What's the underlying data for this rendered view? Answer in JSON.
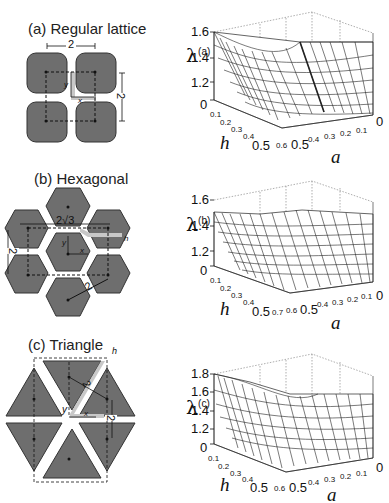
{
  "figure": {
    "panels": [
      {
        "id": "a",
        "title": "(a) Regular lattice",
        "annotations": {
          "width_label": "2",
          "height_label": "2",
          "x_label": "x",
          "y_label": "y"
        },
        "plot": {
          "ylabel": "λ",
          "ylabel_sup": "(a)",
          "z_ticks": [
            "1.6",
            "1.4",
            "1.2",
            "0"
          ],
          "h_ticks_small": [
            "0.1",
            "0.2",
            "0.3",
            "0.4"
          ],
          "h_tick_large": "0.5",
          "a_ticks_small": [
            "0.6",
            "0.4",
            "0.3",
            "0.2",
            "0.1"
          ],
          "a_tick_large_mid": "0.5",
          "a_tick_zero": "0",
          "h_label": "h",
          "a_label": "a"
        }
      },
      {
        "id": "b",
        "title": "(b) Hexagonal",
        "annotations": {
          "width_label": "2√3",
          "height_label": "2",
          "diag_label": "2",
          "h_label": "h",
          "x_label": "x",
          "y_label": "y"
        },
        "plot": {
          "ylabel": "λ",
          "ylabel_sup": "(b)",
          "z_ticks": [
            "1.6",
            "1.4",
            "1.2",
            "0"
          ],
          "h_ticks_small": [
            "0.1",
            "0.2",
            "0.3",
            "0.4"
          ],
          "h_tick_large": "0.5",
          "a_ticks_small": [
            "0.7",
            "0.6",
            "0.4",
            "0.3",
            "0.2",
            "0.1"
          ],
          "a_tick_large_mid": "0.5",
          "a_tick_zero": "0",
          "h_label": "h",
          "a_label": "a"
        }
      },
      {
        "id": "c",
        "title": "(c) Triangle",
        "annotations": {
          "diag_label": "2",
          "height_label": "2",
          "h_label": "h",
          "x_label": "x",
          "y_label": "y"
        },
        "plot": {
          "ylabel": "λ",
          "ylabel_sup": "(c)",
          "z_ticks": [
            "1.8",
            "1.6",
            "1.4",
            "1.2",
            "0"
          ],
          "h_ticks_small": [
            "0.1",
            "0.2",
            "0.3",
            "0.4"
          ],
          "h_tick_large": "0.5",
          "a_ticks_small": [
            "0.6",
            "0.4",
            "0.3",
            "0.2",
            "0.1"
          ],
          "a_tick_large_mid": "0.5",
          "a_tick_zero": "0",
          "h_label": "h",
          "a_label": "a"
        }
      }
    ],
    "colors": {
      "shape_fill": "#6e6e6e",
      "shape_stroke": "#333333",
      "gap_highlight": "#c8c8c8",
      "mesh_line": "#222222",
      "grid_dotted": "#777777"
    }
  }
}
